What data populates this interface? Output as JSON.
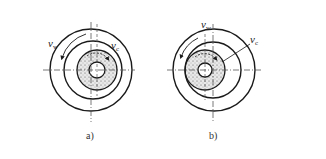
{
  "figure": {
    "panels": [
      {
        "id": "a",
        "caption": "a)",
        "labels": {
          "workpiece_speed": "v",
          "workpiece_sub": "w",
          "wheel_speed": "v",
          "wheel_sub": "c"
        },
        "description": "Internal grinding: wheel (dotted) inside workpiece bore, rotations opposite"
      },
      {
        "id": "b",
        "caption": "b)",
        "labels": {
          "workpiece_speed": "v",
          "workpiece_sub": "w",
          "wheel_speed": "v",
          "wheel_sub": "c"
        },
        "description": "Internal grinding: wheel (dotted) offset left inside workpiece bore"
      }
    ],
    "colors": {
      "line": "#1a1a1a",
      "centerline": "#555555",
      "stipple": "#444444"
    }
  }
}
